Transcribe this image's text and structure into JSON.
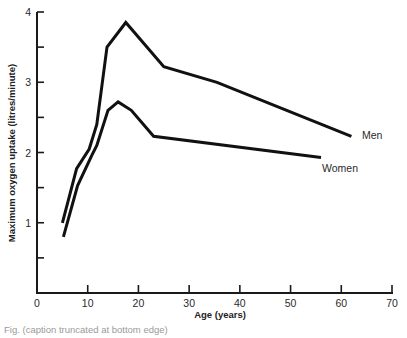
{
  "chart_data": {
    "type": "line",
    "title": "",
    "xlabel": "Age (years)",
    "ylabel": "Maximum oxygen uptake (litres/minute)",
    "xlim": [
      0,
      70
    ],
    "ylim": [
      0,
      4
    ],
    "x_ticks": [
      0,
      10,
      20,
      30,
      40,
      50,
      60,
      70
    ],
    "x_tick_labels": [
      "0",
      "10",
      "20",
      "30",
      "40",
      "50",
      "60",
      "70"
    ],
    "y_ticks": [
      0.5,
      1,
      1.5,
      2,
      2.5,
      3,
      3.5,
      4
    ],
    "y_tick_labels": [
      "",
      "1",
      "",
      "2",
      "",
      "3",
      "",
      "4"
    ],
    "grid": false,
    "legend": "inline labels at line ends",
    "series": [
      {
        "name": "Men",
        "x": [
          5,
          7.8,
          10.3,
          11.8,
          13.8,
          17.5,
          25,
          35.5,
          62
        ],
        "y": [
          1.0,
          1.77,
          2.05,
          2.4,
          3.5,
          3.85,
          3.22,
          3.0,
          2.23
        ]
      },
      {
        "name": "Women",
        "x": [
          5.2,
          8,
          10.8,
          11.8,
          14,
          16,
          18.6,
          23,
          56
        ],
        "y": [
          0.8,
          1.53,
          1.96,
          2.1,
          2.6,
          2.72,
          2.6,
          2.23,
          1.93
        ]
      }
    ]
  },
  "labels": {
    "men": "Men",
    "women": "Women"
  },
  "caption": {
    "text": "Fig. (caption truncated at bottom edge)"
  }
}
